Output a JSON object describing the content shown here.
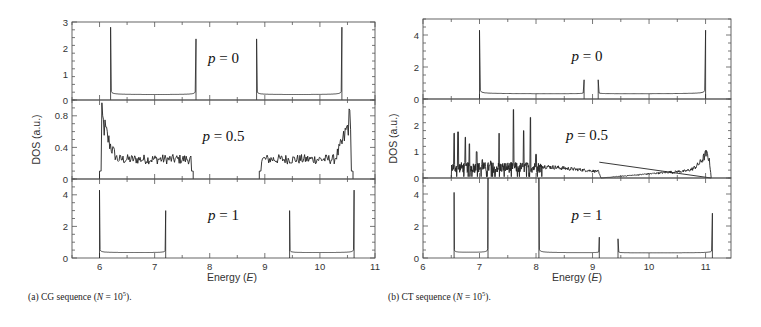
{
  "figure": {
    "captions": [
      {
        "prefix": "(a) CG sequence (",
        "var": "N",
        "eq": " = 10",
        "exp": "5",
        "suffix": ")."
      },
      {
        "prefix": "(b) CT sequence (",
        "var": "N",
        "eq": " = 10",
        "exp": "5",
        "suffix": ")."
      }
    ],
    "ylabel": "DOS (a.u.)",
    "xlabel": "Energy (E)"
  },
  "chart_data": [
    {
      "id": "a",
      "type": "line",
      "title": "(a) CG sequence (N = 10^5)",
      "xlabel": "Energy (E)",
      "ylabel": "DOS (a.u.)",
      "xlim": [
        5.5,
        11
      ],
      "xticks": [
        6,
        7,
        8,
        9,
        10,
        11
      ],
      "grid": false,
      "panels": [
        {
          "label": "p = 0",
          "ylim": [
            0,
            3
          ],
          "yticks": [
            0,
            1,
            2,
            3
          ],
          "bands": [
            [
              6.2,
              7.75,
              2.8,
              2.35
            ],
            [
              8.85,
              10.4,
              2.35,
              2.8
            ]
          ],
          "noisy": false
        },
        {
          "label": "p = 0.5",
          "ylim": [
            0,
            1
          ],
          "yticks": [
            0,
            0.4,
            0.8
          ],
          "bands": [
            [
              6.0,
              7.7,
              0.9,
              0.05
            ],
            [
              8.9,
              10.6,
              0.05,
              0.95
            ]
          ],
          "noisy": true
        },
        {
          "label": "p = 1",
          "ylim": [
            0,
            5
          ],
          "yticks": [
            0,
            2,
            4
          ],
          "bands": [
            [
              6.0,
              7.2,
              4.3,
              3.0
            ],
            [
              9.45,
              10.62,
              3.0,
              4.3
            ]
          ],
          "noisy": false
        }
      ]
    },
    {
      "id": "b",
      "type": "line",
      "title": "(b) CT sequence (N = 10^5)",
      "xlabel": "Energy (E)",
      "ylabel": "DOS (a.u.)",
      "xlim": [
        6,
        11.45
      ],
      "xticks": [
        6,
        7,
        8,
        9,
        10,
        11
      ],
      "grid": false,
      "panels": [
        {
          "label": "p = 0",
          "ylim": [
            0,
            5
          ],
          "yticks": [
            0,
            2,
            4
          ],
          "bands": [
            [
              7.0,
              8.85,
              4.3,
              1.2
            ],
            [
              9.1,
              11.0,
              1.2,
              4.3
            ]
          ],
          "noisy": false
        },
        {
          "label": "p = 0.5",
          "ylim": [
            0,
            3
          ],
          "yticks": [
            0,
            1,
            2
          ],
          "spikes": [
            [
              6.55,
              1.7
            ],
            [
              6.62,
              1.75
            ],
            [
              6.75,
              1.55
            ],
            [
              6.82,
              1.3
            ],
            [
              6.95,
              1.0
            ],
            [
              7.05,
              0.7
            ],
            [
              7.2,
              0.65
            ],
            [
              7.35,
              1.7
            ],
            [
              7.6,
              2.6
            ],
            [
              7.78,
              1.8
            ],
            [
              7.9,
              2.3
            ],
            [
              8.0,
              0.9
            ]
          ],
          "tail": [
            [
              8.1,
              0.45
            ],
            [
              9.1,
              0.25
            ],
            [
              9.15,
              0.0
            ],
            [
              10.5,
              0.25
            ],
            [
              11.0,
              0.9
            ],
            [
              11.1,
              0.0
            ]
          ],
          "noisy": true
        },
        {
          "label": "p = 1",
          "ylim": [
            0,
            5
          ],
          "yticks": [
            0,
            2,
            4
          ],
          "bands": [
            [
              6.55,
              7.15,
              4.1,
              5.5
            ],
            [
              8.05,
              9.12,
              5.0,
              1.3
            ],
            [
              9.45,
              11.12,
              1.2,
              2.8
            ]
          ],
          "noisy": false
        }
      ]
    }
  ]
}
